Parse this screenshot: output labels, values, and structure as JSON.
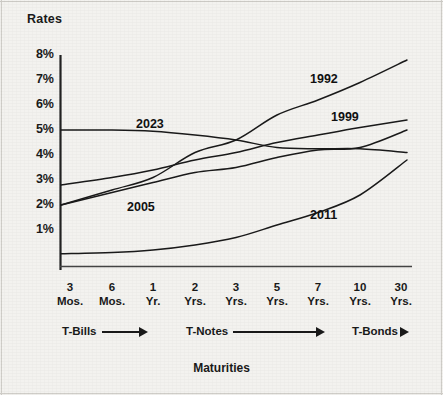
{
  "figure": {
    "y_axis_title": "Rates",
    "x_axis_title": "Maturities",
    "background_color": "#f3f2ef",
    "line_color": "#1a1a1a"
  },
  "y_ticks": [
    {
      "label": "8%",
      "value": 8,
      "py": 55
    },
    {
      "label": "7%",
      "value": 7,
      "py": 80
    },
    {
      "label": "6%",
      "value": 6,
      "py": 105
    },
    {
      "label": "5%",
      "value": 5,
      "py": 130
    },
    {
      "label": "4%",
      "value": 4,
      "py": 155
    },
    {
      "label": "3%",
      "value": 3,
      "py": 180
    },
    {
      "label": "2%",
      "value": 2,
      "py": 205
    },
    {
      "label": "1%",
      "value": 1,
      "py": 230
    }
  ],
  "x_ticks": [
    {
      "num": "3",
      "unit": "Mos.",
      "px": 70
    },
    {
      "num": "6",
      "unit": "Mos.",
      "px": 112
    },
    {
      "num": "1",
      "unit": "Yr.",
      "px": 153
    },
    {
      "num": "2",
      "unit": "Yrs.",
      "px": 195
    },
    {
      "num": "3",
      "unit": "Yrs.",
      "px": 236
    },
    {
      "num": "5",
      "unit": "Yrs.",
      "px": 277
    },
    {
      "num": "7",
      "unit": "Yrs.",
      "px": 318
    },
    {
      "num": "10",
      "unit": "Yrs.",
      "px": 360
    },
    {
      "num": "30",
      "unit": "Yrs.",
      "px": 401
    }
  ],
  "instrument_groups": [
    {
      "label": "T-Bills",
      "arrow": "⟶",
      "px": 62,
      "py": 325
    },
    {
      "label": "T-Notes",
      "arrow": "⟶",
      "px": 186,
      "py": 325
    },
    {
      "label": "T-Bonds",
      "arrow": "➔",
      "px": 352,
      "py": 325
    }
  ],
  "series_labels": [
    {
      "text": "1992",
      "px": 310,
      "py": 72
    },
    {
      "text": "1999",
      "px": 331,
      "py": 110
    },
    {
      "text": "2023",
      "px": 136,
      "py": 117
    },
    {
      "text": "2005",
      "px": 127,
      "py": 200
    },
    {
      "text": "2011",
      "px": 310,
      "py": 208
    }
  ],
  "chart_data": {
    "type": "line",
    "title": "",
    "xlabel": "Maturities",
    "ylabel": "Rates",
    "ylim": [
      0,
      8
    ],
    "grid": false,
    "legend": "inline-annotations",
    "x": [
      "3 Mos.",
      "6 Mos.",
      "1 Yr.",
      "2 Yrs.",
      "3 Yrs.",
      "5 Yrs.",
      "7 Yrs.",
      "10 Yrs.",
      "30 Yrs."
    ],
    "y_unit": "percent",
    "series": [
      {
        "name": "1992",
        "values": [
          2.0,
          2.6,
          3.1,
          4.1,
          4.6,
          5.6,
          6.2,
          6.9,
          7.8
        ]
      },
      {
        "name": "1999",
        "values": [
          2.8,
          3.1,
          3.4,
          3.8,
          4.1,
          4.5,
          4.8,
          5.1,
          5.4
        ]
      },
      {
        "name": "2023",
        "values": [
          5.0,
          5.0,
          4.95,
          4.8,
          4.6,
          4.3,
          4.25,
          4.25,
          4.1
        ]
      },
      {
        "name": "2005",
        "values": [
          2.0,
          2.5,
          2.9,
          3.3,
          3.5,
          3.9,
          4.2,
          4.3,
          5.0
        ]
      },
      {
        "name": "2011",
        "values": [
          0.05,
          0.1,
          0.2,
          0.4,
          0.7,
          1.2,
          1.7,
          2.4,
          3.8
        ]
      }
    ]
  }
}
